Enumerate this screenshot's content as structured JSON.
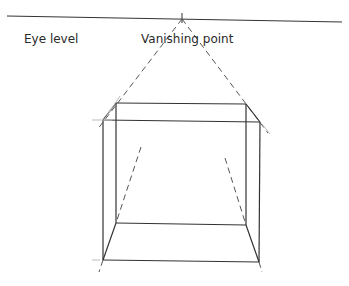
{
  "diagram": {
    "labels": {
      "eye_level": "Eye level",
      "vanishing_point": "Vanishing point"
    },
    "colors": {
      "line": "#333333",
      "guide": "#555555",
      "faint": "#bbbbbb"
    },
    "horizon": {
      "x1": 7,
      "y1": 16,
      "x2": 342,
      "y2": 22
    },
    "vanishing_point": {
      "x": 182,
      "y": 19
    },
    "box": {
      "front": {
        "tl": [
          103,
          120
        ],
        "tr": [
          260,
          122
        ],
        "br": [
          259,
          262
        ],
        "bl": [
          103,
          260
        ]
      },
      "back": {
        "tl": [
          116,
          103
        ],
        "tr": [
          246,
          104
        ],
        "br": [
          246,
          225
        ],
        "bl": [
          116,
          223
        ]
      }
    },
    "guides": [
      {
        "name": "vp-to-left-top",
        "x1": 182,
        "y1": 19,
        "x2": 97,
        "y2": 130
      },
      {
        "name": "vp-to-right-top",
        "x1": 182,
        "y1": 19,
        "x2": 268,
        "y2": 133
      },
      {
        "name": "inner-left",
        "x1": 141,
        "y1": 147,
        "x2": 116,
        "y2": 223
      },
      {
        "name": "inner-right",
        "x1": 225,
        "y1": 158,
        "x2": 246,
        "y2": 225
      },
      {
        "name": "below-left",
        "x1": 103,
        "y1": 260,
        "x2": 99,
        "y2": 272
      },
      {
        "name": "below-right",
        "x1": 259,
        "y1": 262,
        "x2": 262,
        "y2": 272
      }
    ]
  }
}
